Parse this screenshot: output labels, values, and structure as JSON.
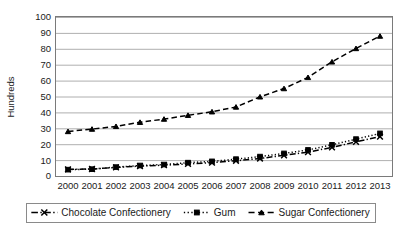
{
  "chart_data": {
    "type": "line",
    "title": "",
    "xlabel": "",
    "ylabel": "Hundreds",
    "categories": [
      "2000",
      "2001",
      "2002",
      "2003",
      "2004",
      "2005",
      "2006",
      "2007",
      "2008",
      "2009",
      "2010",
      "2011",
      "2012",
      "2013"
    ],
    "ylim": [
      0,
      100
    ],
    "ytick_step": 10,
    "yticks": [
      "0",
      "10",
      "20",
      "30",
      "40",
      "50",
      "60",
      "70",
      "80",
      "90",
      "100"
    ],
    "grid": true,
    "legend_position": "bottom",
    "series": [
      {
        "name": "Chocolate Confectionery",
        "marker": "x",
        "dash": "dashdot",
        "values": [
          4.2,
          4.4,
          5.4,
          6.2,
          6.8,
          7.6,
          8.4,
          9.6,
          11.0,
          13.0,
          15.0,
          18.0,
          21.5,
          24.8
        ]
      },
      {
        "name": "Gum",
        "marker": "square",
        "dash": "dotted",
        "values": [
          4.0,
          4.3,
          5.6,
          6.6,
          7.2,
          8.4,
          9.2,
          10.6,
          12.2,
          14.2,
          16.4,
          19.6,
          23.2,
          26.8
        ]
      },
      {
        "name": "Sugar Confectionery",
        "marker": "triangle",
        "dash": "dashed",
        "values": [
          28.0,
          29.5,
          31.2,
          33.8,
          35.8,
          38.2,
          40.4,
          43.4,
          49.8,
          55.0,
          62.0,
          71.8,
          80.2,
          88.0
        ]
      }
    ]
  },
  "legend": {
    "items": [
      {
        "label": "Chocolate Confectionery"
      },
      {
        "label": "Gum"
      },
      {
        "label": "Sugar Confectionery"
      }
    ]
  },
  "colors": {
    "series": "#000000",
    "grid": "#9a9a9a",
    "text": "#1a1a1a",
    "background": "#ffffff"
  }
}
